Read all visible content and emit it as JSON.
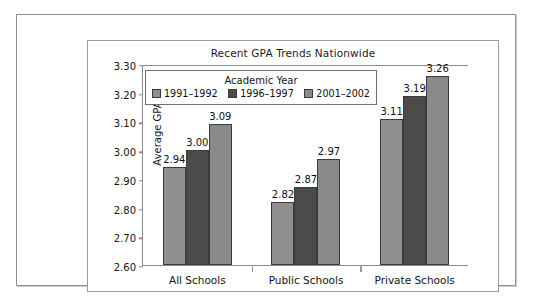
{
  "chart_data": {
    "type": "bar",
    "title": "Recent GPA Trends Nationwide",
    "xlabel": "",
    "ylabel": "Average GPA",
    "categories": [
      "All Schools",
      "Public Schools",
      "Private Schools"
    ],
    "series": [
      {
        "name": "1991–1992",
        "values": [
          2.94,
          2.82,
          3.11
        ],
        "color": "#909090"
      },
      {
        "name": "1996–1997",
        "values": [
          3.0,
          2.87,
          3.19
        ],
        "color": "#4b4b4b"
      },
      {
        "name": "2001–2002",
        "values": [
          3.09,
          2.97,
          3.26
        ],
        "color": "#8a8a8a"
      }
    ],
    "value_labels": [
      [
        "2.94",
        "3.00",
        "3.09"
      ],
      [
        "2.82",
        "2.87",
        "2.97"
      ],
      [
        "3.11",
        "3.19",
        "3.26"
      ]
    ],
    "ylim": [
      2.6,
      3.3
    ],
    "yticks": [
      3.3,
      3.2,
      3.1,
      3.0,
      2.9,
      2.8,
      2.7,
      2.6
    ],
    "ytick_labels": [
      "3.30",
      "3.20",
      "3.10",
      "3.00",
      "2.90",
      "2.80",
      "2.70",
      "2.60"
    ],
    "grid": false,
    "legend_position": "inside-top-left",
    "legend_title": "Academic Year",
    "bar_outline_color": "#3b3b3b",
    "axis_color": "#8b8b8b"
  },
  "legend": {
    "title": "Academic Year",
    "entries": [
      {
        "label": "1991–1992",
        "color": "#909090"
      },
      {
        "label": "1996–1997",
        "color": "#4b4b4b"
      },
      {
        "label": "2001–2002",
        "color": "#8a8a8a"
      }
    ]
  }
}
